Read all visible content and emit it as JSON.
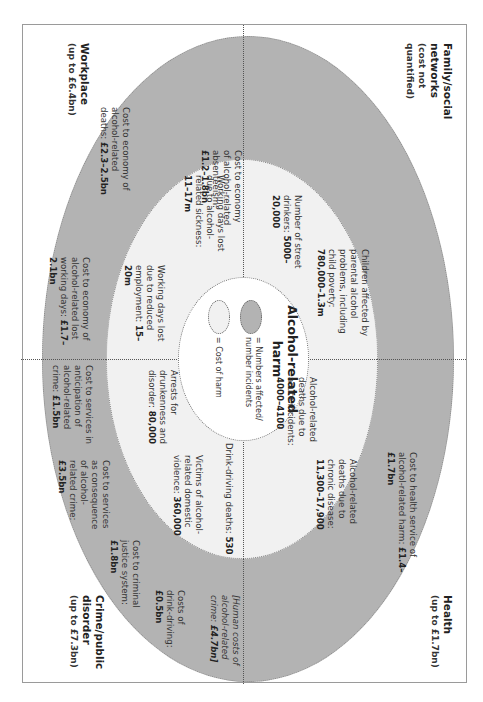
{
  "diagram": {
    "title": "Alcohol-related harm",
    "legend": {
      "numbers_label": "= Numbers affected/ number incidents",
      "cost_label": "= Cost of harm",
      "numbers_color": "#b3b3b3",
      "cost_color": "#f1f1f1"
    },
    "quadrants": {
      "family": {
        "heading": "Family/social networks",
        "subheading": "(cost not quantified)",
        "numbers": [
          {
            "text": "Children affected by parental alcohol problems, including child poverty:",
            "value": "780,000–1.3m"
          },
          {
            "text": "Number of street drinkers:",
            "value": "5000–20,000"
          }
        ]
      },
      "health": {
        "heading": "Health",
        "subheading": "(up to £1.7bn)",
        "costs": [
          {
            "text": "Cost to health service of alcohol-related harm:",
            "value": "£1.4–£1.7bn"
          }
        ],
        "numbers": [
          {
            "text": "Alcohol-related deaths due to acute incidents:",
            "value": "4000–4100"
          },
          {
            "text": "Alcohol-related deaths due to chronic disease:",
            "value": "11,300–17,900"
          }
        ]
      },
      "workplace": {
        "heading": "Workplace",
        "subheading": "(up to £6.4bn)",
        "costs": [
          {
            "text": "Cost to economy of alcohol-related absenteeism:",
            "value": "£1.2–1.8bn"
          },
          {
            "text": "Cost to economy of alcohol-related deaths:",
            "value": "£2.3–2.5bn"
          },
          {
            "text": "Cost to economy of alcohol-related lost working days:",
            "value": "£1.7–2.1bn"
          }
        ],
        "numbers": [
          {
            "text": "Working days lost due to alcohol-related sickness:",
            "value": "11–17m"
          },
          {
            "text": "Working days lost due to reduced employment:",
            "value": "15–20m"
          }
        ]
      },
      "crime": {
        "heading": "Crime/public disorder",
        "subheading": "(up to £7.3bn)",
        "costs": [
          {
            "text": "Cost to services in anticipation of alcohol-related crime:",
            "value": "£1.5bn"
          },
          {
            "text": "Cost to services as consequence of alcohol-related crime:",
            "value": "£3.5bn"
          },
          {
            "text": "Cost to criminal justice system:",
            "value": "£1.8bn"
          },
          {
            "text": "Costs of drink-driving:",
            "value": "£0.5bn"
          },
          {
            "text": "[Human costs of alcohol-related crime:",
            "value": "£4.7bn]"
          }
        ],
        "numbers": [
          {
            "text": "Arrests for drunkenness and disorder:",
            "value": "80,000"
          },
          {
            "text": "Victims of alcohol-related domestic violence:",
            "value": "360,000"
          },
          {
            "text": "Drink-driving deaths:",
            "value": "530"
          }
        ]
      }
    }
  }
}
